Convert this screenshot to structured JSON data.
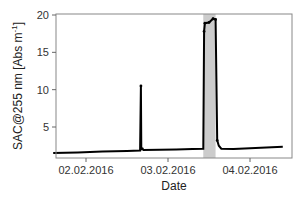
{
  "chart_data": {
    "type": "line",
    "title": "",
    "xlabel": "Date",
    "ylabel": "SAC@255 nm [Abs m⁻¹]",
    "ylim": [
      1,
      20.3
    ],
    "yticks": [
      5,
      10,
      15,
      20
    ],
    "xticks": [
      "02.02.2016",
      "03.02.2016",
      "04.02.2016"
    ],
    "grid": false,
    "legend": null,
    "x_day_range": [
      1.58,
      4.5
    ],
    "series": [
      {
        "name": "SAC@255 nm",
        "color": "#000000",
        "x_days": [
          1.6,
          1.9,
          2.2,
          2.5,
          2.66,
          2.67,
          2.675,
          2.69,
          2.7,
          2.9,
          3.1,
          3.3,
          3.43,
          3.44,
          3.45,
          3.5,
          3.55,
          3.58,
          3.6,
          3.62,
          3.65,
          3.8,
          4.0,
          4.2,
          4.4
        ],
        "values": [
          1.5,
          1.6,
          1.7,
          1.8,
          1.85,
          10.5,
          2.0,
          2.1,
          1.9,
          1.95,
          2.0,
          2.05,
          2.1,
          17.8,
          18.9,
          19.0,
          19.5,
          19.4,
          3.2,
          2.5,
          2.1,
          2.05,
          2.15,
          2.25,
          2.35
        ]
      }
    ],
    "annotations": [
      {
        "type": "shaded_band",
        "x_start_day": 3.43,
        "x_end_day": 3.58,
        "color": "#cccccc"
      }
    ]
  },
  "labels": {
    "y_ticks": [
      "5",
      "10",
      "15",
      "20"
    ],
    "x_ticks": [
      "02.02.2016",
      "03.02.2016",
      "04.02.2016"
    ],
    "xlabel": "Date",
    "ylabel_main": "SAC@255 nm [Abs m",
    "ylabel_sup": "-1",
    "ylabel_end": "]"
  }
}
